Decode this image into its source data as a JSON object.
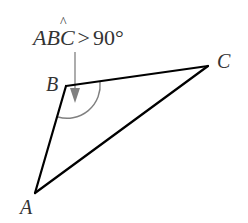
{
  "diagram": {
    "condition": {
      "angle_name": "ABC",
      "angle_hat_on": "B",
      "operator": ">",
      "value": "90°"
    },
    "vertices": {
      "A": {
        "label": "A"
      },
      "B": {
        "label": "B"
      },
      "C": {
        "label": "C"
      }
    },
    "angle_marker": {
      "vertex": "B",
      "type": "arc",
      "meaning": "obtuse angle"
    },
    "colors": {
      "triangle": "#000000",
      "arc": "#808080",
      "arrow": "#808080",
      "text": "#333333"
    }
  }
}
